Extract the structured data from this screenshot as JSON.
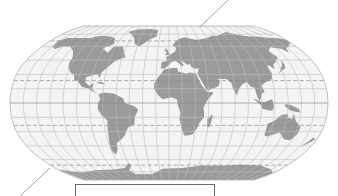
{
  "map": {
    "projection": "Robinson",
    "style": "grayscale world map with graticule",
    "colors": {
      "background": "#ffffff",
      "ocean": "#f4f4f4",
      "land": "#9a9a9a",
      "graticule": "#bdbdbd",
      "special_parallels": "#8c8c8c",
      "outline": "#b0b0b0",
      "leader_line": "#8a8a8a",
      "caption_border": "#6a6a6a"
    },
    "graticule": {
      "meridian_step_deg": 15,
      "parallel_step_deg": 15
    },
    "special_parallels": [
      {
        "name": "Arctic Circle",
        "style": "dashed"
      },
      {
        "name": "Tropic of Cancer",
        "style": "dashed"
      },
      {
        "name": "Equator",
        "style": "solid"
      },
      {
        "name": "Tropic of Capricorn",
        "style": "dashed"
      },
      {
        "name": "Antarctic Circle",
        "style": "dashed"
      }
    ],
    "continents": [
      "North America",
      "South America",
      "Europe",
      "Africa",
      "Asia",
      "Australia",
      "Antarctica",
      "Greenland"
    ]
  },
  "annotations": {
    "leader_lines": [
      {
        "name": "top-right-leader",
        "from": [
          200,
          27
        ],
        "to": [
          228,
          0
        ]
      },
      {
        "name": "bottom-left-leader",
        "from": [
          50,
          168
        ],
        "to": [
          20,
          196
        ]
      }
    ],
    "caption_box": {
      "text": ""
    }
  }
}
